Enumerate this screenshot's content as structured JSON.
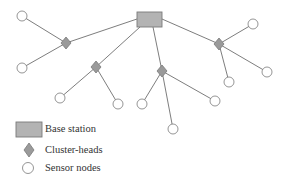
{
  "colors": {
    "edge": "#6e6e6e",
    "node_stroke": "#7a7a7a",
    "base_fill": "#b3b3b3",
    "head_fill": "#9a9a9a",
    "sensor_fill": "#ffffff",
    "text": "#333333"
  },
  "diagram": {
    "type": "network-topology",
    "base_station": {
      "x": 137,
      "y": 12,
      "w": 25,
      "h": 15
    },
    "cluster_heads": [
      {
        "id": "ch1",
        "x": 66,
        "y": 43
      },
      {
        "id": "ch2",
        "x": 96,
        "y": 67
      },
      {
        "id": "ch3",
        "x": 162,
        "y": 71
      },
      {
        "id": "ch4",
        "x": 219,
        "y": 44
      }
    ],
    "sensor_nodes": [
      {
        "id": "s1",
        "x": 22,
        "y": 16,
        "head": "ch1"
      },
      {
        "id": "s2",
        "x": 22,
        "y": 68,
        "head": "ch1"
      },
      {
        "id": "s3",
        "x": 60,
        "y": 98,
        "head": "ch2"
      },
      {
        "id": "s4",
        "x": 118,
        "y": 104,
        "head": "ch2"
      },
      {
        "id": "s5",
        "x": 142,
        "y": 104,
        "head": "ch3"
      },
      {
        "id": "s6",
        "x": 215,
        "y": 101,
        "head": "ch3"
      },
      {
        "id": "s7",
        "x": 173,
        "y": 129,
        "head": "ch3"
      },
      {
        "id": "s8",
        "x": 253,
        "y": 24,
        "head": "ch4"
      },
      {
        "id": "s9",
        "x": 267,
        "y": 72,
        "head": "ch4"
      },
      {
        "id": "s10",
        "x": 229,
        "y": 82,
        "head": "ch4"
      }
    ]
  },
  "legend": {
    "items": [
      {
        "symbol": "rectangle",
        "label": "Base station"
      },
      {
        "symbol": "diamond",
        "label": "Cluster-heads"
      },
      {
        "symbol": "circle",
        "label": "Sensor nodes"
      }
    ]
  }
}
